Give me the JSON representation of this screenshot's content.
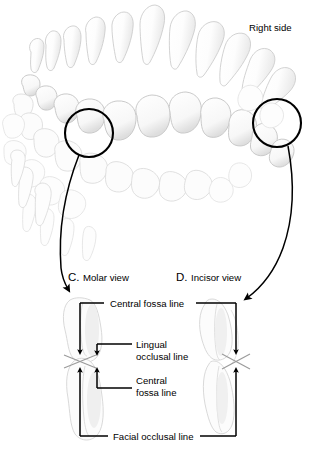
{
  "figure": {
    "title_top_right": "Right side",
    "panels": [
      {
        "id": "C",
        "letter": "C.",
        "name": "Molar view",
        "label": "C. Molar view"
      },
      {
        "id": "D",
        "letter": "D.",
        "name": "Incisor view",
        "label": "D. Incisor view"
      }
    ],
    "callouts": [
      {
        "name": "central-fossa-line-top",
        "text": "Central fossa line"
      },
      {
        "name": "lingual-occlusal-line",
        "text_line1": "Lingual",
        "text_line2": "occlusal line"
      },
      {
        "name": "central-fossa-line-inner",
        "text_line1": "Central",
        "text_line2": "fossa line"
      },
      {
        "name": "facial-occlusal-line",
        "text": "Facial occlusal line"
      }
    ],
    "magnifier_circles": [
      {
        "name": "molar-region-circle",
        "cx": 89,
        "cy": 133,
        "r": 24
      },
      {
        "name": "incisor-region-circle",
        "cx": 277,
        "cy": 123,
        "r": 24
      }
    ],
    "colors": {
      "ink": "#000000",
      "tooth_outline": "#c9c9c9",
      "tooth_fill": "#fbfbfb",
      "tooth_shade": "#e3e3e3",
      "background": "#ffffff"
    }
  }
}
